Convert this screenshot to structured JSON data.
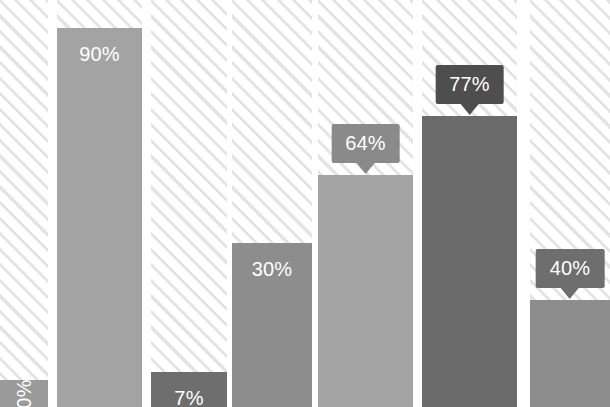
{
  "chart_data": {
    "type": "bar",
    "title": "",
    "subtitle": "",
    "xlabel": "",
    "ylabel": "",
    "ylim": [
      0,
      100
    ],
    "grid": false,
    "legend": null,
    "categories": [
      "1",
      "2",
      "3",
      "4",
      "5",
      "6",
      "7"
    ],
    "values": [
      0,
      90,
      7,
      30,
      64,
      77,
      40
    ],
    "data_labels": [
      "0%",
      "90%",
      "7%",
      "30%",
      "64%",
      "77%",
      "40%"
    ],
    "series": [
      {
        "name": "value",
        "values": [
          0,
          90,
          7,
          30,
          64,
          77,
          40
        ]
      }
    ]
  },
  "style": {
    "background": "#ffffff",
    "hatch_stripe": "#e4e4e4",
    "label_text": "#ffffff"
  },
  "bars": [
    {
      "label": "0%",
      "value": 0,
      "fill": "#9a9a9a",
      "label_mode": "inside-rotated",
      "callout_fill": ""
    },
    {
      "label": "90%",
      "value": 90,
      "fill": "#a3a3a3",
      "label_mode": "inside",
      "callout_fill": ""
    },
    {
      "label": "7%",
      "value": 7,
      "fill": "#6e6e6e",
      "label_mode": "inside",
      "callout_fill": ""
    },
    {
      "label": "30%",
      "value": 30,
      "fill": "#8d8d8d",
      "label_mode": "inside",
      "callout_fill": ""
    },
    {
      "label": "64%",
      "value": 64,
      "fill": "#a3a3a3",
      "label_mode": "callout",
      "callout_fill": "#8a8a8a"
    },
    {
      "label": "77%",
      "value": 77,
      "fill": "#6b6b6b",
      "label_mode": "callout",
      "callout_fill": "#4e4e4e"
    },
    {
      "label": "40%",
      "value": 40,
      "fill": "#8d8d8d",
      "label_mode": "callout",
      "callout_fill": "#6e6e6e"
    }
  ],
  "layout": {
    "columns": [
      {
        "left": 0,
        "width": 48
      },
      {
        "left": 57,
        "width": 85
      },
      {
        "left": 151,
        "width": 76
      },
      {
        "left": 232,
        "width": 80
      },
      {
        "left": 318,
        "width": 95
      },
      {
        "left": 422,
        "width": 95
      },
      {
        "left": 530,
        "width": 80
      }
    ],
    "bar_tops": [
      380,
      28,
      372,
      243,
      175,
      116,
      300
    ],
    "chart_height": 407,
    "chart_width": 610
  }
}
